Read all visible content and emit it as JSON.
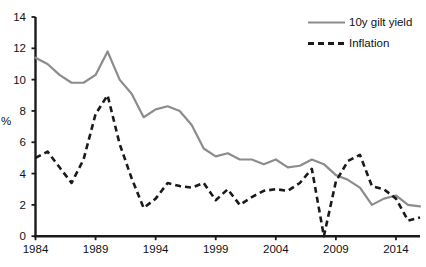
{
  "chart_data": {
    "type": "line",
    "title": "",
    "xlabel": "",
    "ylabel": "%",
    "xlim": [
      1984,
      2016
    ],
    "ylim": [
      0,
      14
    ],
    "grid": false,
    "legend_position": "top-right",
    "xticks": [
      "1984",
      "1989",
      "1994",
      "1999",
      "2004",
      "2009",
      "2014"
    ],
    "xtick_values": [
      1984,
      1989,
      1994,
      1999,
      2004,
      2009,
      2014
    ],
    "yticks": [
      "0",
      "2",
      "4",
      "6",
      "8",
      "10",
      "12",
      "14"
    ],
    "ytick_values": [
      0,
      2,
      4,
      6,
      8,
      10,
      12,
      14
    ],
    "x": [
      1984,
      1985,
      1986,
      1987,
      1988,
      1989,
      1990,
      1991,
      1992,
      1993,
      1994,
      1995,
      1996,
      1997,
      1998,
      1999,
      2000,
      2001,
      2002,
      2003,
      2004,
      2005,
      2006,
      2007,
      2008,
      2009,
      2010,
      2011,
      2012,
      2013,
      2014,
      2015,
      2016
    ],
    "series": [
      {
        "name": "10y gilt yield",
        "style": "solid",
        "color": "#8c8c8c",
        "values": [
          11.4,
          11.0,
          10.3,
          9.8,
          9.8,
          10.3,
          11.8,
          10.0,
          9.1,
          7.6,
          8.1,
          8.3,
          8.0,
          7.1,
          5.6,
          5.1,
          5.3,
          4.9,
          4.9,
          4.6,
          4.9,
          4.4,
          4.5,
          4.9,
          4.6,
          3.9,
          3.6,
          3.1,
          2.0,
          2.4,
          2.6,
          2.0,
          1.9
        ]
      },
      {
        "name": "Inflation",
        "style": "dashed",
        "color": "#1a1a1a",
        "values": [
          5.0,
          5.4,
          4.4,
          3.4,
          4.9,
          7.8,
          9.0,
          5.9,
          3.7,
          1.8,
          2.4,
          3.4,
          3.2,
          3.1,
          3.4,
          2.3,
          3.0,
          2.0,
          2.5,
          2.9,
          3.0,
          2.9,
          3.4,
          4.3,
          0.0,
          3.5,
          4.8,
          5.2,
          3.2,
          3.0,
          2.4,
          1.0,
          1.2
        ]
      }
    ]
  },
  "legend": {
    "entries": [
      {
        "label": "10y gilt yield",
        "swatch": "solid-line-swatch"
      },
      {
        "label": "Inflation",
        "swatch": "dashed-line-swatch"
      }
    ]
  },
  "axes": {
    "y_title": "%"
  },
  "colors": {
    "gilt": "#8c8c8c",
    "inflation": "#1a1a1a",
    "axis": "#1a1a1a",
    "background": "#ffffff"
  }
}
